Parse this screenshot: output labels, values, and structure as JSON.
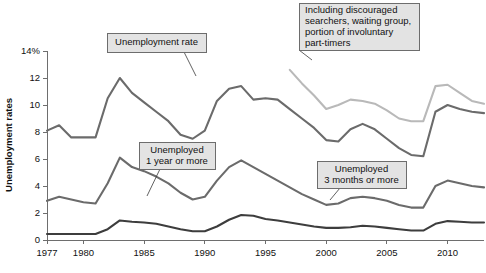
{
  "chart_data": {
    "type": "line",
    "title": "",
    "xlabel": "",
    "ylabel": "Unemployment rates",
    "xlim": [
      1977,
      2013
    ],
    "ylim": [
      0,
      14
    ],
    "grid": false,
    "legend_position": "inline-callouts",
    "x_ticks": [
      "1977",
      "1980",
      "1985",
      "1990",
      "1995",
      "2000",
      "2005",
      "2010"
    ],
    "x_tick_values": [
      1977,
      1980,
      1985,
      1990,
      1995,
      2000,
      2005,
      2010
    ],
    "y_ticks": [
      "0",
      "2",
      "4",
      "6",
      "8",
      "10",
      "12",
      "14%"
    ],
    "y_tick_values": [
      0,
      2,
      4,
      6,
      8,
      10,
      12,
      14
    ],
    "series": [
      {
        "name": "Unemployment rate",
        "color": "#6b6b6b",
        "width": 2.1,
        "x": [
          1977,
          1978,
          1979,
          1980,
          1981,
          1982,
          1983,
          1984,
          1985,
          1986,
          1987,
          1988,
          1989,
          1990,
          1991,
          1992,
          1993,
          1994,
          1995,
          1996,
          1997,
          1998,
          1999,
          2000,
          2001,
          2002,
          2003,
          2004,
          2005,
          2006,
          2007,
          2008,
          2009,
          2010,
          2011,
          2012,
          2013
        ],
        "values": [
          8.1,
          8.5,
          7.6,
          7.6,
          7.6,
          10.5,
          12.0,
          10.9,
          10.2,
          9.5,
          8.8,
          7.8,
          7.5,
          8.1,
          10.3,
          11.2,
          11.4,
          10.4,
          10.5,
          10.4,
          9.7,
          9.0,
          8.3,
          7.4,
          7.3,
          8.2,
          8.6,
          8.2,
          7.5,
          6.8,
          6.3,
          6.2,
          9.5,
          10.0,
          9.7,
          9.5,
          9.4
        ],
        "label_text": "Unemployment rate"
      },
      {
        "name": "Including discouraged searchers, waiting group, portion of involuntary part-timers",
        "color": "#b9b9b9",
        "width": 2.1,
        "x": [
          1997,
          1998,
          1999,
          2000,
          2001,
          2002,
          2003,
          2004,
          2005,
          2006,
          2007,
          2008,
          2009,
          2010,
          2011,
          2012,
          2013
        ],
        "values": [
          12.6,
          11.6,
          10.7,
          9.7,
          10.0,
          10.4,
          10.3,
          10.1,
          9.6,
          9.0,
          8.8,
          8.8,
          11.4,
          11.5,
          10.9,
          10.3,
          10.1
        ],
        "label_text": "Including discouraged searchers, waiting group, portion of involuntary part-timers"
      },
      {
        "name": "Unemployed 3 months or more",
        "color": "#6b6b6b",
        "width": 2.1,
        "x": [
          1977,
          1978,
          1979,
          1980,
          1981,
          1982,
          1983,
          1984,
          1985,
          1986,
          1987,
          1988,
          1989,
          1990,
          1991,
          1992,
          1993,
          1994,
          1995,
          1996,
          1997,
          1998,
          1999,
          2000,
          2001,
          2002,
          2003,
          2004,
          2005,
          2006,
          2007,
          2008,
          2009,
          2010,
          2011,
          2012,
          2013
        ],
        "values": [
          2.9,
          3.2,
          3.0,
          2.8,
          2.7,
          4.2,
          6.1,
          5.4,
          5.1,
          4.7,
          4.2,
          3.5,
          3.0,
          3.2,
          4.4,
          5.4,
          5.9,
          5.4,
          4.9,
          4.4,
          3.9,
          3.4,
          3.0,
          2.6,
          2.7,
          3.1,
          3.2,
          3.1,
          2.9,
          2.6,
          2.4,
          2.4,
          4.0,
          4.4,
          4.2,
          4.0,
          3.9
        ],
        "label_text": "Unemployed 3 months or more"
      },
      {
        "name": "Unemployed 1 year or more",
        "color": "#3d3d3d",
        "width": 2.1,
        "x": [
          1977,
          1978,
          1979,
          1980,
          1981,
          1982,
          1983,
          1984,
          1985,
          1986,
          1987,
          1988,
          1989,
          1990,
          1991,
          1992,
          1993,
          1994,
          1995,
          1996,
          1997,
          1998,
          1999,
          2000,
          2001,
          2002,
          2003,
          2004,
          2005,
          2006,
          2007,
          2008,
          2009,
          2010,
          2011,
          2012,
          2013
        ],
        "values": [
          0.45,
          0.45,
          0.45,
          0.45,
          0.45,
          0.8,
          1.45,
          1.35,
          1.3,
          1.2,
          1.0,
          0.8,
          0.65,
          0.65,
          1.0,
          1.5,
          1.85,
          1.8,
          1.55,
          1.45,
          1.3,
          1.15,
          1.0,
          0.9,
          0.9,
          0.95,
          1.05,
          1.0,
          0.9,
          0.8,
          0.7,
          0.7,
          1.2,
          1.4,
          1.35,
          1.3,
          1.3
        ],
        "label_text": "Unemployed 1 year or more"
      }
    ],
    "annotations": [
      {
        "id": "unemployment-rate",
        "lines": [
          "Unemployment rate"
        ],
        "align": "center",
        "box": {
          "x": 107,
          "y": 33,
          "w": 99,
          "h": 19
        },
        "leader": [
          [
            184,
            52
          ],
          [
            196,
            76
          ]
        ]
      },
      {
        "id": "including-discouraged",
        "lines": [
          "Including discouraged",
          "searchers, waiting group,",
          "portion of involuntary",
          "part-timers"
        ],
        "align": "left",
        "box": {
          "x": 299,
          "y": 3,
          "w": 120,
          "h": 47
        },
        "leader": [
          [
            299,
            50
          ],
          [
            312,
            60
          ]
        ]
      },
      {
        "id": "unemployed-1-year",
        "lines": [
          "Unemployed",
          "1 year or more"
        ],
        "align": "center",
        "box": {
          "x": 139,
          "y": 142,
          "w": 76,
          "h": 27
        },
        "leader": [
          [
            160,
            169
          ],
          [
            147,
            196
          ]
        ]
      },
      {
        "id": "unemployed-3-months",
        "lines": [
          "Unemployed",
          "3 months or more"
        ],
        "align": "center",
        "box": {
          "x": 317,
          "y": 161,
          "w": 89,
          "h": 27
        },
        "leader": [
          [
            340,
            188
          ],
          [
            330,
            200
          ]
        ]
      }
    ],
    "colors": {
      "axis": "#6e6e6e",
      "text": "#111111",
      "callout_fill": "#e3e3e3",
      "callout_border": "#6d6d6d",
      "background": "#ffffff"
    }
  }
}
